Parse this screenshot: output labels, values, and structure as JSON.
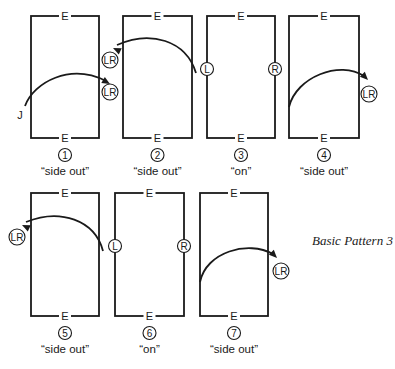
{
  "figure": {
    "title": "Basic Pattern 3",
    "edge_label": "E",
    "start_marker": "J",
    "panels": [
      {
        "number": "1",
        "caption": "“side out”",
        "rect": {
          "x": 31,
          "y": 16,
          "w": 68,
          "h": 122
        },
        "badges": [
          {
            "text": "LR",
            "cx": 110,
            "cy": 92
          }
        ],
        "arc": {
          "path": "M25,106 C34,82 70,63 106,81",
          "arrow": {
            "x": 110,
            "y": 84,
            "angle": 30
          }
        }
      },
      {
        "number": "2",
        "caption": "“side out”",
        "rect": {
          "x": 123,
          "y": 16,
          "w": 69,
          "h": 122
        },
        "badges": [
          {
            "text": "LR",
            "cx": 110,
            "cy": 60
          }
        ],
        "arc": {
          "path": "M196,73 C186,40 150,30 117,45",
          "arrow": {
            "x": 113,
            "y": 48,
            "angle": 205
          }
        }
      },
      {
        "number": "3",
        "caption": "“on”",
        "rect": {
          "x": 207,
          "y": 16,
          "w": 68,
          "h": 122
        },
        "badges": [
          {
            "text": "L",
            "cx": 207,
            "cy": 69
          },
          {
            "text": "R",
            "cx": 275,
            "cy": 69
          }
        ],
        "arc": null
      },
      {
        "number": "4",
        "caption": "“side out”",
        "rect": {
          "x": 289,
          "y": 16,
          "w": 70,
          "h": 122
        },
        "badges": [
          {
            "text": "LR",
            "cx": 369,
            "cy": 94
          }
        ],
        "arc": {
          "path": "M289,107 C296,77 340,60 364,76",
          "arrow": {
            "x": 368,
            "y": 80,
            "angle": 45
          }
        }
      },
      {
        "number": "5",
        "caption": "“side out”",
        "rect": {
          "x": 31,
          "y": 193,
          "w": 68,
          "h": 123
        },
        "badges": [
          {
            "text": "LR",
            "cx": 17,
            "cy": 237
          }
        ],
        "arc": {
          "path": "M103,251 C95,220 60,208 26,222",
          "arrow": {
            "x": 22,
            "y": 225,
            "angle": 205
          }
        }
      },
      {
        "number": "6",
        "caption": "“on”",
        "rect": {
          "x": 115,
          "y": 193,
          "w": 69,
          "h": 123
        },
        "badges": [
          {
            "text": "L",
            "cx": 115,
            "cy": 246
          },
          {
            "text": "R",
            "cx": 184,
            "cy": 246
          }
        ],
        "arc": null
      },
      {
        "number": "7",
        "caption": "“side out”",
        "rect": {
          "x": 200,
          "y": 193,
          "w": 68,
          "h": 123
        },
        "badges": [
          {
            "text": "LR",
            "cx": 281,
            "cy": 271
          }
        ],
        "arc": {
          "path": "M200,282 C206,252 248,240 273,254",
          "arrow": {
            "x": 277,
            "y": 258,
            "angle": 45
          }
        }
      }
    ]
  }
}
